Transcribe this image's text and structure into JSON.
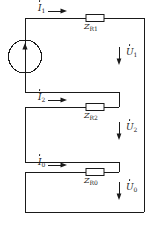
{
  "diagram": {
    "type": "electrical-circuit",
    "stroke_color": "#1a1a1a",
    "background_color": "#ffffff",
    "source": {
      "name": "voltage-source",
      "symbol": "circle-with-arrow",
      "arrow_direction": "up"
    },
    "branches": [
      {
        "current_label": "I",
        "current_sub": "1",
        "impedance_label": "Z",
        "impedance_sub": "R1",
        "voltage_label": "U",
        "voltage_sub": "1",
        "current_arrow": "right",
        "voltage_arrow": "down"
      },
      {
        "current_label": "I",
        "current_sub": "2",
        "impedance_label": "Z",
        "impedance_sub": "R2",
        "voltage_label": "U",
        "voltage_sub": "2",
        "current_arrow": "right",
        "voltage_arrow": "down"
      },
      {
        "current_label": "I",
        "current_sub": "0",
        "impedance_label": "Z",
        "impedance_sub": "R0",
        "voltage_label": "U",
        "voltage_sub": "0",
        "current_arrow": "right",
        "voltage_arrow": "down"
      }
    ]
  }
}
